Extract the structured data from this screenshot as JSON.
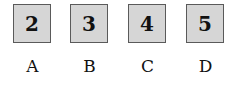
{
  "options": [
    {
      "tile": "2",
      "label": "A"
    },
    {
      "tile": "3",
      "label": "B"
    },
    {
      "tile": "4",
      "label": "C"
    },
    {
      "tile": "5",
      "label": "D"
    }
  ],
  "colors": {
    "tile_fill": "#d6d6d6",
    "tile_border": "#5a5a5a",
    "text": "#111111"
  }
}
